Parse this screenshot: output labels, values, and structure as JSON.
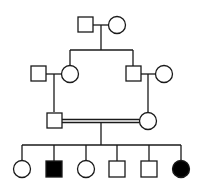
{
  "diagram": {
    "type": "pedigree",
    "colors": {
      "line": "#1a1a1a",
      "affected": "#000000",
      "unaffected": "#ffffff"
    },
    "generations": [
      {
        "label": "I",
        "individuals": [
          {
            "id": "I-1",
            "sex": "male",
            "affected": false
          },
          {
            "id": "I-2",
            "sex": "female",
            "affected": false
          }
        ]
      },
      {
        "label": "II",
        "individuals": [
          {
            "id": "II-1",
            "sex": "male",
            "affected": false,
            "note": "married in"
          },
          {
            "id": "II-2",
            "sex": "female",
            "affected": false,
            "note": "daughter of I-1 x I-2"
          },
          {
            "id": "II-3",
            "sex": "male",
            "affected": false,
            "note": "son of I-1 x I-2"
          },
          {
            "id": "II-4",
            "sex": "female",
            "affected": false,
            "note": "married in"
          }
        ]
      },
      {
        "label": "III",
        "individuals": [
          {
            "id": "III-1",
            "sex": "male",
            "affected": false,
            "note": "son of II-1 x II-2"
          },
          {
            "id": "III-2",
            "sex": "female",
            "affected": false,
            "note": "daughter of II-3 x II-4"
          }
        ],
        "consanguineous_mating": true
      },
      {
        "label": "IV",
        "individuals": [
          {
            "id": "IV-1",
            "sex": "female",
            "affected": false
          },
          {
            "id": "IV-2",
            "sex": "male",
            "affected": true
          },
          {
            "id": "IV-3",
            "sex": "female",
            "affected": false
          },
          {
            "id": "IV-4",
            "sex": "male",
            "affected": false
          },
          {
            "id": "IV-5",
            "sex": "male",
            "affected": false
          },
          {
            "id": "IV-6",
            "sex": "female",
            "affected": true
          }
        ]
      }
    ]
  }
}
